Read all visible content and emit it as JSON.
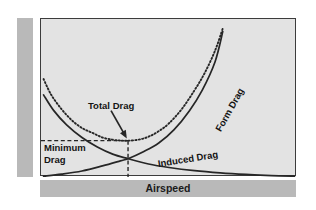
{
  "chart_data": {
    "type": "line",
    "title": "",
    "xlabel": "Airspeed",
    "ylabel": "Total Drag",
    "grid": false,
    "legend_position": "inline-annotations",
    "xlim": [
      0,
      100
    ],
    "ylim": [
      0,
      100
    ],
    "axis_ticks": {
      "x": [],
      "y": []
    },
    "annotations": [
      {
        "name": "total-drag",
        "text": "Total Drag",
        "kind": "arrow-callout",
        "points_to_curve": "Total Drag",
        "target_point": [
          34,
          23
        ]
      },
      {
        "name": "minimum-drag",
        "text": "Minimum Drag",
        "lines": [
          "Minimum",
          "Drag"
        ],
        "kind": "dashed-guide-label"
      },
      {
        "name": "induced-drag",
        "text": "Induced Drag",
        "kind": "curve-label",
        "rotation_deg": -9
      },
      {
        "name": "form-drag",
        "text": "Form Drag",
        "kind": "curve-label",
        "rotation_deg": -61
      }
    ],
    "guides": {
      "minimum_drag_horizontal_y": 23,
      "minimum_drag_vertical_x": 34,
      "style": "dashed"
    },
    "series": [
      {
        "name": "Total Drag",
        "style": "dotted",
        "color": "#262626",
        "x": [
          1,
          4,
          8,
          12,
          16,
          20,
          24,
          28,
          31,
          34,
          38,
          42,
          46,
          50,
          55,
          60,
          64,
          68,
          71
        ],
        "y": [
          62,
          52,
          43,
          36,
          31,
          28,
          25,
          23.6,
          23.1,
          23,
          23.6,
          25.5,
          29,
          34,
          43,
          55,
          66,
          80,
          94
        ]
      },
      {
        "name": "Form Drag",
        "style": "solid",
        "color": "#262626",
        "x": [
          1,
          8,
          16,
          24,
          31,
          34,
          40,
          46,
          52,
          58,
          63,
          68,
          71
        ],
        "y": [
          0.5,
          1.8,
          3.8,
          7,
          10.2,
          11.6,
          16,
          21.5,
          30,
          42,
          55,
          73,
          92
        ]
      },
      {
        "name": "Induced Drag",
        "style": "solid",
        "color": "#262626",
        "x": [
          1,
          5,
          10,
          16,
          22,
          28,
          34,
          42,
          50,
          60,
          70,
          80,
          90,
          99
        ],
        "y": [
          52,
          42,
          33,
          25,
          19,
          14.5,
          11.6,
          8.2,
          6,
          4,
          2.6,
          1.6,
          0.9,
          0.5
        ]
      }
    ]
  },
  "axis_bands": {
    "y_band_color": "#b9b9b9",
    "x_band_color": "#b9b9b9"
  },
  "colors": {
    "plot_background": "#e3e3e3",
    "page_background": "#ffffff",
    "frame": "#3c3c3c",
    "curve": "#262626",
    "text": "#141414"
  }
}
